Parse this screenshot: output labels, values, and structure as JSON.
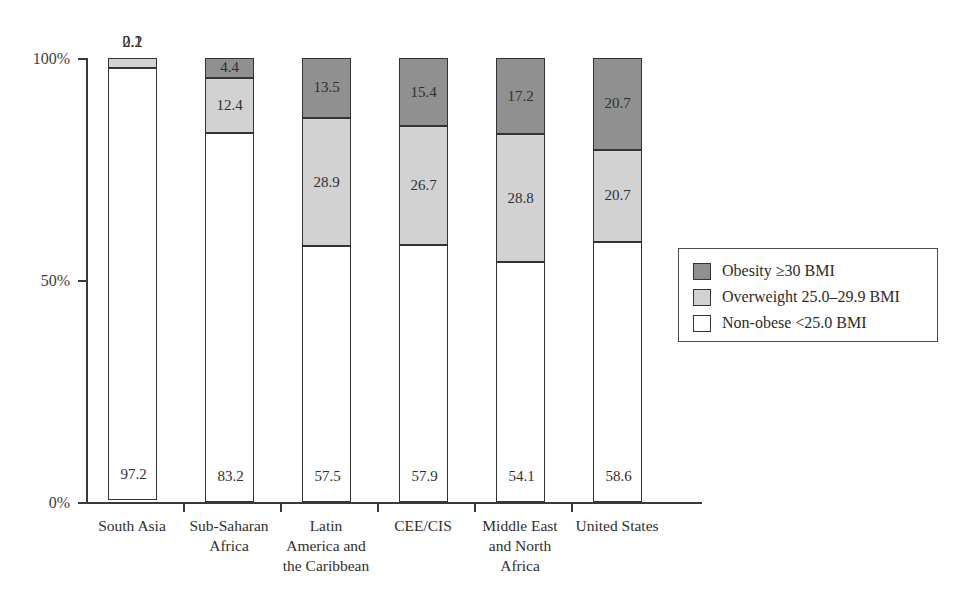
{
  "chart_data": {
    "type": "bar",
    "subtype": "stacked-100-percent",
    "title": "",
    "xlabel": "",
    "ylabel": "",
    "ylim": [
      0,
      100
    ],
    "ytick_labels": [
      "0%",
      "50%",
      "100%"
    ],
    "ytick_values": [
      0,
      50,
      100
    ],
    "grid": false,
    "legend_position": "right-middle",
    "categories": [
      "South Asia",
      "Sub-Saharan Africa",
      "Latin America and the Caribbean",
      "CEE/CIS",
      "Middle East and North Africa",
      "United States"
    ],
    "category_label_lines": [
      [
        "South Asia"
      ],
      [
        "Sub-Saharan",
        "Africa"
      ],
      [
        "Latin",
        "America and",
        "the Caribbean"
      ],
      [
        "CEE/CIS"
      ],
      [
        "Middle East",
        "and North",
        "Africa"
      ],
      [
        "United States"
      ]
    ],
    "series": [
      {
        "name": "Obesity ≥30 BMI",
        "color": "#909090",
        "values": [
          0.1,
          4.4,
          13.5,
          15.4,
          17.2,
          20.7
        ],
        "labels": [
          "0.1",
          "4.4",
          "13.5",
          "15.4",
          "17.2",
          "20.7"
        ]
      },
      {
        "name": "Overweight 25.0–29.9 BMI",
        "color": "#d2d2d2",
        "values": [
          2.2,
          12.4,
          28.9,
          26.7,
          28.8,
          20.7
        ],
        "labels": [
          "2.2",
          "12.4",
          "28.9",
          "26.7",
          "28.8",
          "20.7"
        ]
      },
      {
        "name": "Non-obese <25.0 BMI",
        "color": "#ffffff",
        "values": [
          97.2,
          83.2,
          57.5,
          57.9,
          54.1,
          58.6
        ],
        "labels": [
          "97.2",
          "83.2",
          "57.5",
          "57.9",
          "54.1",
          "58.6"
        ]
      }
    ]
  },
  "legend": {
    "items": [
      {
        "label": "Obesity ≥30 BMI",
        "swatch": "obese"
      },
      {
        "label": "Overweight 25.0–29.9 BMI",
        "swatch": "over"
      },
      {
        "label": "Non-obese <25.0 BMI",
        "swatch": "non"
      }
    ]
  },
  "axis": {
    "y_labels": [
      "100%",
      "50%",
      "0%"
    ]
  }
}
